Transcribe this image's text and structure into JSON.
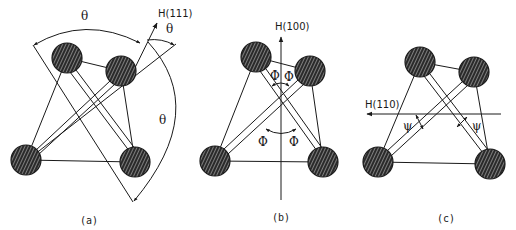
{
  "figure": {
    "panels": [
      {
        "id": "a",
        "caption": "(a)",
        "field_label": "H(111)",
        "angle_symbol": "θ",
        "angle_labels": [
          "θ",
          "θ",
          "θ"
        ]
      },
      {
        "id": "b",
        "caption": "(b)",
        "field_label": "H(100)",
        "angle_symbol": "Φ",
        "angle_labels": [
          "Φ",
          "Φ",
          "Φ",
          "Φ"
        ]
      },
      {
        "id": "c",
        "caption": "(c)",
        "field_label": "H(110)",
        "angle_symbol": "ψ",
        "angle_labels": [
          "ψ",
          "ψ"
        ]
      }
    ],
    "colors": {
      "line": "#1a1a1a",
      "atom_fill": "#2a2a2a",
      "background": "#ffffff"
    }
  }
}
